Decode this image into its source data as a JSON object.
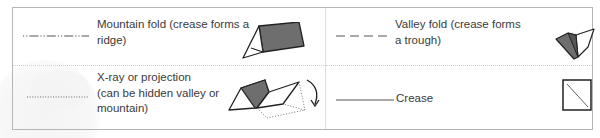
{
  "legend": {
    "items": [
      {
        "id": "mountain-fold",
        "line_style": "dash-dot-dot",
        "label": "Mountain fold (crease forms a ridge)",
        "label_lines": [
          "Mountain fold (crease forms a",
          "ridge)"
        ],
        "icon": "mountain-fold-icon"
      },
      {
        "id": "valley-fold",
        "line_style": "dashed",
        "label": "Valley fold (crease forms a trough)",
        "label_lines": [
          "Valley fold (crease forms",
          "a trough)"
        ],
        "icon": "valley-fold-icon"
      },
      {
        "id": "xray-projection",
        "line_style": "dotted",
        "label": "X-ray or projection (can be hidden valley or mountain)",
        "label_lines": [
          "X-ray or projection",
          "(can be hidden valley or",
          "mountain)"
        ],
        "icon": "xray-fold-icon"
      },
      {
        "id": "crease",
        "line_style": "solid",
        "label": "Crease",
        "label_lines": [
          "Crease"
        ],
        "icon": "crease-square-icon"
      }
    ]
  },
  "colors": {
    "text": "#3a3a3a",
    "border": "#b5b5b5",
    "fold_fill": "#6e6e6e",
    "line": "#555555"
  }
}
